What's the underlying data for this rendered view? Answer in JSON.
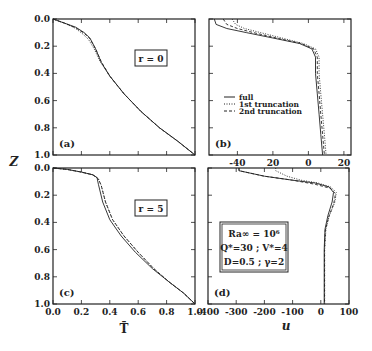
{
  "figure": {
    "y_axis_title": "Z",
    "x_axis_title_left": "T̄",
    "x_axis_title_right": "u"
  },
  "legend": {
    "entries": [
      {
        "label": "full",
        "style": "solid"
      },
      {
        "label": "1st truncation",
        "style": "dotted"
      },
      {
        "label": "2nd truncation",
        "style": "dashed"
      }
    ]
  },
  "parameter_box": {
    "line1": "Ra∞ = 10⁶",
    "line2": "Q*=30 ; V*=4",
    "line3": "D=0.5 ; γ=2"
  },
  "chart_data": [
    {
      "panel": "(a)",
      "type": "line",
      "annotation": "r = 0",
      "xlabel": "",
      "ylabel": "Z",
      "xlim": [
        0.0,
        1.0
      ],
      "ylim": [
        1.0,
        0.0
      ],
      "yticks": [
        "0.0",
        "0.2",
        "0.4",
        "0.6",
        "0.8",
        "1.0"
      ],
      "xticks": [],
      "series": [
        {
          "name": "full",
          "style": "solid",
          "x": [
            0.0,
            0.08,
            0.16,
            0.22,
            0.26,
            0.3,
            0.34,
            0.4,
            0.5,
            0.62,
            0.75,
            0.88,
            1.0
          ],
          "y": [
            0.0,
            0.03,
            0.06,
            0.1,
            0.14,
            0.22,
            0.32,
            0.42,
            0.55,
            0.68,
            0.8,
            0.9,
            1.0
          ]
        },
        {
          "name": "1st truncation",
          "style": "dotted",
          "x": [
            0.0,
            0.08,
            0.16,
            0.21,
            0.25,
            0.29,
            0.33,
            0.4,
            0.5,
            0.62,
            0.75,
            0.88,
            1.0
          ],
          "y": [
            0.0,
            0.03,
            0.07,
            0.11,
            0.15,
            0.22,
            0.31,
            0.42,
            0.55,
            0.68,
            0.8,
            0.9,
            1.0
          ]
        },
        {
          "name": "2nd truncation",
          "style": "dashed",
          "x": [
            0.0,
            0.08,
            0.16,
            0.22,
            0.26,
            0.3,
            0.34,
            0.4,
            0.5,
            0.62,
            0.75,
            0.88,
            1.0
          ],
          "y": [
            0.0,
            0.03,
            0.065,
            0.105,
            0.145,
            0.22,
            0.315,
            0.42,
            0.55,
            0.68,
            0.8,
            0.9,
            1.0
          ]
        }
      ]
    },
    {
      "panel": "(b)",
      "type": "line",
      "annotation": "",
      "xlabel": "",
      "ylabel": "",
      "xlim": [
        -56,
        24
      ],
      "ylim": [
        1.0,
        0.0
      ],
      "xticks": [
        -40,
        -20,
        0,
        20
      ],
      "xtick_labels": [
        "-40",
        "20",
        "0",
        "20"
      ],
      "series": [
        {
          "name": "full",
          "style": "solid",
          "x": [
            -53,
            -52,
            -46,
            -35,
            -20,
            -5,
            2,
            4,
            4,
            5,
            6,
            7,
            8
          ],
          "y": [
            0.0,
            0.04,
            0.07,
            0.1,
            0.14,
            0.18,
            0.22,
            0.28,
            0.4,
            0.55,
            0.7,
            0.85,
            1.0
          ]
        },
        {
          "name": "1st truncation",
          "style": "dotted",
          "x": [
            -43,
            -41,
            -36,
            -27,
            -15,
            -3,
            4,
            6,
            6,
            7,
            8,
            9,
            10
          ],
          "y": [
            0.0,
            0.04,
            0.07,
            0.1,
            0.14,
            0.18,
            0.22,
            0.28,
            0.4,
            0.55,
            0.7,
            0.85,
            1.0
          ]
        },
        {
          "name": "2nd truncation",
          "style": "dashed",
          "x": [
            -48,
            -46,
            -40,
            -31,
            -18,
            -4,
            3,
            5,
            5,
            6,
            7,
            8,
            9
          ],
          "y": [
            0.0,
            0.04,
            0.07,
            0.1,
            0.14,
            0.18,
            0.22,
            0.28,
            0.4,
            0.55,
            0.7,
            0.85,
            1.0
          ]
        }
      ]
    },
    {
      "panel": "(c)",
      "type": "line",
      "annotation": "r = 5",
      "xlabel": "T̄",
      "ylabel": "Z",
      "xlim": [
        0.0,
        1.0
      ],
      "ylim": [
        1.0,
        0.0
      ],
      "xticks": [
        "0.0",
        "0.2",
        "0.4",
        "0.6",
        "0.8",
        "1.0"
      ],
      "yticks": [
        "0.0",
        "0.2",
        "0.4",
        "0.6",
        "0.8",
        "1.0"
      ],
      "series": [
        {
          "name": "full",
          "style": "solid",
          "x": [
            0.0,
            0.1,
            0.2,
            0.28,
            0.31,
            0.32,
            0.35,
            0.4,
            0.48,
            0.58,
            0.7,
            0.82,
            0.92,
            1.0
          ],
          "y": [
            0.0,
            0.01,
            0.03,
            0.05,
            0.07,
            0.12,
            0.25,
            0.38,
            0.5,
            0.62,
            0.74,
            0.84,
            0.92,
            1.0
          ]
        },
        {
          "name": "1st truncation",
          "style": "dotted",
          "x": [
            0.0,
            0.1,
            0.2,
            0.28,
            0.32,
            0.34,
            0.37,
            0.42,
            0.5,
            0.6,
            0.71,
            0.82,
            0.92,
            1.0
          ],
          "y": [
            0.0,
            0.01,
            0.03,
            0.05,
            0.08,
            0.13,
            0.25,
            0.38,
            0.5,
            0.62,
            0.74,
            0.84,
            0.92,
            1.0
          ]
        },
        {
          "name": "2nd truncation",
          "style": "dashed",
          "x": [
            0.0,
            0.1,
            0.2,
            0.28,
            0.32,
            0.34,
            0.37,
            0.42,
            0.5,
            0.6,
            0.71,
            0.82,
            0.92,
            1.0
          ],
          "y": [
            0.0,
            0.01,
            0.03,
            0.05,
            0.08,
            0.13,
            0.25,
            0.38,
            0.5,
            0.62,
            0.74,
            0.84,
            0.92,
            1.0
          ]
        }
      ]
    },
    {
      "panel": "(d)",
      "type": "line",
      "annotation": "",
      "xlabel": "u",
      "ylabel": "",
      "xlim": [
        -400,
        100
      ],
      "ylim": [
        1.0,
        0.0
      ],
      "xticks": [
        "-400",
        "-300",
        "-200",
        "-100",
        "0",
        "100"
      ],
      "series": [
        {
          "name": "full",
          "style": "solid",
          "x": [
            -290,
            -290,
            -200,
            -100,
            -20,
            30,
            45,
            40,
            25,
            15,
            12,
            12,
            12
          ],
          "y": [
            0.0,
            0.02,
            0.06,
            0.09,
            0.11,
            0.14,
            0.18,
            0.25,
            0.35,
            0.45,
            0.6,
            0.8,
            1.0
          ]
        },
        {
          "name": "1st truncation",
          "style": "dotted",
          "x": [
            -160,
            -160,
            -120,
            -70,
            -10,
            35,
            55,
            50,
            30,
            18,
            14,
            14,
            14
          ],
          "y": [
            0.0,
            0.02,
            0.06,
            0.09,
            0.11,
            0.14,
            0.18,
            0.25,
            0.35,
            0.45,
            0.6,
            0.8,
            1.0
          ]
        },
        {
          "name": "2nd truncation",
          "style": "dashed",
          "x": [
            -290,
            -290,
            -200,
            -100,
            -20,
            35,
            52,
            46,
            28,
            16,
            13,
            13,
            13
          ],
          "y": [
            0.0,
            0.02,
            0.06,
            0.09,
            0.12,
            0.15,
            0.19,
            0.26,
            0.36,
            0.46,
            0.6,
            0.8,
            1.0
          ]
        }
      ]
    }
  ]
}
